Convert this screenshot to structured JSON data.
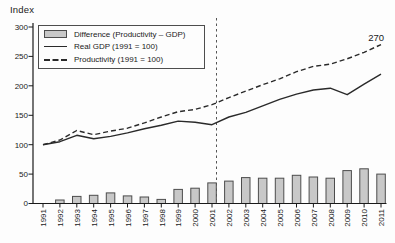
{
  "chart": {
    "ylabel": "Index",
    "annotation": "270"
  },
  "legend": {
    "items": [
      {
        "label": "Difference (Productivity – GDP)",
        "swatch": "gray-bar"
      },
      {
        "label": "Real GDP (1991 = 100)",
        "swatch": "solid-line"
      },
      {
        "label": "Productivity (1991 = 100)",
        "swatch": "dashed-line"
      }
    ]
  },
  "colors": {
    "line": "#2a2a2a",
    "bar_fill": "#c8c8c8",
    "bar_border": "#4d4d4d",
    "axis": "#1a1a1a",
    "tick_text": "#1a1a1a",
    "reference_line": "#555555",
    "background": "#fdfdfd"
  },
  "chart_data": {
    "type": "bar",
    "subtype": "combo-bars-with-two-lines",
    "title": "",
    "ylabel": "Index",
    "xlabel": "",
    "ylim": [
      0,
      300
    ],
    "yticks": [
      0,
      50,
      100,
      150,
      200,
      250,
      300
    ],
    "grid": false,
    "legend_position": "top-left",
    "vline_at_category": "2001",
    "categories": [
      "1991",
      "1992",
      "1993",
      "1994",
      "1995",
      "1996",
      "1997",
      "1998",
      "1999",
      "2000",
      "2001",
      "2002",
      "2003",
      "2004",
      "2005",
      "2006",
      "2007",
      "2008",
      "2009",
      "2010",
      "2011"
    ],
    "series": [
      {
        "name": "Difference (Productivity – GDP)",
        "render": "bar",
        "values": [
          0,
          6,
          12,
          14,
          18,
          13,
          11,
          7,
          24,
          26,
          35,
          38,
          44,
          43,
          43,
          48,
          45,
          43,
          56,
          59,
          50
        ]
      },
      {
        "name": "Real GDP (1991 = 100)",
        "render": "line-solid",
        "values": [
          100,
          105,
          116,
          110,
          114,
          120,
          127,
          133,
          140,
          138,
          134,
          147,
          155,
          166,
          177,
          186,
          193,
          196,
          185,
          203,
          220
        ]
      },
      {
        "name": "Productivity (1991 = 100)",
        "render": "line-dashed",
        "values": [
          100,
          108,
          124,
          117,
          123,
          128,
          137,
          147,
          156,
          160,
          168,
          180,
          191,
          202,
          212,
          224,
          233,
          237,
          246,
          257,
          270
        ]
      }
    ],
    "annotations": [
      {
        "text": "270",
        "category": "2011",
        "value": 270,
        "series": "Productivity (1991 = 100)"
      }
    ]
  }
}
